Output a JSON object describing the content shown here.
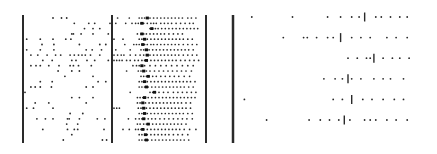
{
  "chart_data": [
    {
      "type": "scatter",
      "title": "",
      "xlabel": "",
      "ylabel": "",
      "description": "Raster plot, sparse irregular spiking (left panel)",
      "x_range": [
        0,
        100
      ],
      "rows": [
        [
          33,
          43,
          49
        ],
        [
          58,
          75,
          82,
          100
        ],
        [
          70,
          80,
          88
        ],
        [
          55,
          57,
          66,
          80,
          98
        ],
        [
          2,
          18,
          33,
          48,
          54
        ],
        [
          20,
          34,
          64,
          88,
          95
        ],
        [
          2,
          18,
          34,
          72,
          79,
          90
        ],
        [
          7,
          15,
          26,
          36,
          42,
          53,
          58,
          63,
          67,
          71,
          77,
          88
        ],
        [
          21,
          32,
          55,
          60,
          73,
          82,
          98
        ],
        [
          7,
          13,
          18,
          28,
          40,
          53,
          57,
          63,
          78
        ],
        [
          39,
          55,
          64
        ],
        [
          47,
          80
        ],
        [
          18,
          32,
          86,
          95
        ],
        [
          7,
          12,
          18,
          31,
          72,
          80
        ],
        [
          0
        ],
        [
          55,
          64,
          80
        ],
        [
          12,
          28,
          72
        ],
        [
          2,
          10,
          33
        ],
        [
          53,
          68
        ],
        [
          14,
          24,
          33,
          50,
          52,
          64,
          85,
          94
        ],
        [
          49,
          62
        ],
        [
          21,
          50,
          58,
          62,
          93
        ],
        [
          55
        ],
        [
          45,
          91,
          96
        ]
      ]
    },
    {
      "type": "scatter",
      "title": "",
      "xlabel": "",
      "ylabel": "",
      "description": "Raster plot, dense burst after bold marker (middle panel)",
      "x_range": [
        0,
        100
      ],
      "marker_label": "bold tick marks per row",
      "rows": [
        {
          "spikes": [
            4,
            17,
            28,
            31,
            34,
            37,
            40,
            44,
            48,
            52,
            56,
            60,
            64,
            68,
            72,
            76,
            82,
            86,
            91
          ],
          "marker": 37
        },
        {
          "spikes": [
            2,
            13,
            20,
            24,
            27,
            30,
            33,
            37,
            41,
            44,
            47,
            52,
            56,
            60,
            64,
            69,
            74,
            79,
            84,
            88
          ],
          "marker": 31
        },
        {
          "spikes": [
            40,
            43,
            46,
            49,
            53,
            57,
            61,
            65,
            69,
            73,
            77,
            81,
            85,
            89,
            93
          ],
          "marker": 42
        },
        {
          "spikes": [
            26,
            30,
            33,
            36,
            40,
            44,
            48,
            52,
            56,
            61,
            66,
            71,
            76
          ],
          "marker": 31
        },
        {
          "spikes": [
            0,
            10,
            28,
            31,
            34,
            37,
            41,
            45,
            49,
            53,
            57,
            61,
            65,
            69,
            73,
            77,
            82,
            87
          ],
          "marker": 34
        },
        {
          "spikes": [
            12,
            22,
            25,
            28,
            31,
            34,
            37,
            41,
            44,
            48,
            52,
            56,
            60,
            64,
            68,
            72,
            77,
            82,
            87,
            92
          ],
          "marker": 32
        },
        {
          "spikes": [
            2,
            18,
            30,
            33,
            36,
            39,
            43,
            47,
            51,
            55,
            59,
            63,
            67,
            71,
            75,
            79,
            83,
            88
          ],
          "marker": 36
        },
        {
          "spikes": [
            0,
            4,
            8,
            11,
            18,
            24,
            29,
            33,
            36,
            40,
            44,
            48,
            52,
            56,
            60,
            64,
            68,
            72,
            77,
            82,
            87,
            92
          ],
          "marker": 37
        },
        {
          "spikes": [
            0,
            3,
            6,
            9,
            14,
            18,
            23,
            27,
            31,
            34,
            37,
            41,
            45,
            49,
            53,
            57,
            61,
            65,
            69,
            74,
            79,
            84,
            89,
            94
          ],
          "marker": 36
        },
        {
          "spikes": [
            21,
            25,
            28,
            31,
            34,
            40,
            46,
            52,
            58,
            64,
            70,
            76,
            82,
            88
          ],
          "marker": 31
        },
        {
          "spikes": [
            14,
            27,
            30,
            33,
            36,
            40,
            45,
            50,
            55,
            60,
            65,
            70,
            75,
            80,
            86
          ],
          "marker": 33
        },
        {
          "spikes": [
            30,
            33,
            36,
            39,
            43,
            47,
            52,
            57,
            62,
            67,
            72,
            78,
            84
          ],
          "marker": 38
        },
        {
          "spikes": [
            28,
            31,
            34,
            37,
            41,
            45,
            49,
            53,
            57,
            61,
            65,
            69,
            73,
            77,
            81,
            85,
            90
          ],
          "marker": 34
        },
        {
          "spikes": [
            28,
            31,
            34,
            38,
            42,
            46,
            50,
            54,
            58,
            62,
            66,
            70,
            74,
            78,
            83,
            88
          ],
          "marker": 36
        },
        {
          "spikes": [
            18,
            40,
            43,
            46,
            50,
            55,
            60,
            66,
            71,
            76,
            81,
            86,
            91
          ],
          "marker": 45
        },
        {
          "spikes": [
            26,
            29,
            32,
            35,
            38,
            42,
            46,
            50,
            54,
            58,
            62,
            66,
            70,
            74,
            78,
            82,
            86,
            90
          ],
          "marker": 34
        },
        {
          "spikes": [
            26,
            29,
            32,
            35,
            39,
            43,
            47,
            51,
            55,
            59,
            63,
            67,
            71,
            75,
            80,
            85
          ],
          "marker": 32
        },
        {
          "spikes": [
            0,
            3,
            6,
            27,
            30,
            33,
            36,
            40,
            44,
            48,
            52,
            56,
            60,
            64,
            68,
            72,
            76,
            80,
            85
          ],
          "marker": 33
        },
        {
          "spikes": [
            28,
            31,
            34,
            37,
            41,
            45,
            49,
            53,
            57,
            61,
            65,
            69,
            73,
            77,
            82,
            87
          ],
          "marker": 34
        },
        {
          "spikes": [
            16,
            24,
            28,
            31,
            34,
            38,
            42,
            46,
            51,
            56,
            61,
            66,
            71,
            76,
            81,
            87
          ],
          "marker": 33
        },
        {
          "spikes": [
            26,
            29,
            33,
            36,
            39,
            43,
            47,
            51,
            55,
            59,
            63,
            67,
            71,
            75,
            80
          ],
          "marker": 38
        },
        {
          "spikes": [
            10,
            17,
            24,
            27,
            30,
            33,
            37,
            41,
            45,
            49,
            53,
            57,
            61,
            65,
            69,
            73,
            78,
            84,
            91
          ],
          "marker": 32
        },
        {
          "spikes": [
            28,
            31,
            34,
            37,
            41,
            45,
            49,
            53,
            57,
            61,
            66,
            71,
            76,
            82
          ],
          "marker": 35
        },
        {
          "spikes": [
            28,
            31,
            34,
            38,
            42,
            46,
            50,
            54,
            58,
            62,
            66,
            70,
            74,
            78,
            83
          ],
          "marker": 36
        }
      ]
    },
    {
      "type": "scatter",
      "title": "",
      "xlabel": "",
      "ylabel": "",
      "description": "Raster plot, six trials with bold tick markers (right panel)",
      "x_range": [
        0,
        100
      ],
      "rows": [
        {
          "spikes": [
            8,
            30,
            49,
            56,
            62,
            66,
            75,
            78,
            83,
            88,
            92
          ],
          "marker": 69
        },
        {
          "spikes": [
            25,
            36,
            38,
            43,
            49,
            52,
            62,
            67,
            72,
            81,
            86,
            92
          ],
          "marker": 56
        },
        {
          "spikes": [
            60,
            65,
            70,
            72,
            79,
            84,
            88,
            93
          ],
          "marker": 74
        },
        {
          "spikes": [
            47,
            53,
            57,
            62,
            67,
            74,
            79,
            83,
            90
          ],
          "marker": 60
        },
        {
          "spikes": [
            4,
            52,
            57,
            68,
            73,
            79,
            85,
            90
          ],
          "marker": 62
        },
        {
          "spikes": [
            16,
            39,
            45,
            50,
            55,
            61,
            69,
            72,
            75,
            81,
            86,
            92
          ],
          "marker": 58
        }
      ]
    }
  ]
}
